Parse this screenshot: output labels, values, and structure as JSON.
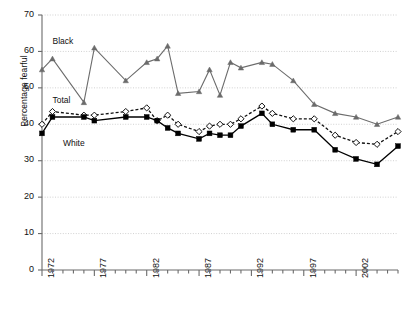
{
  "chart_data": {
    "type": "line",
    "title": "",
    "xlabel": "",
    "ylabel": "Percentage fearful",
    "ylim": [
      0,
      70
    ],
    "xlim": [
      1972,
      2006
    ],
    "yticks": [
      0,
      10,
      20,
      30,
      40,
      50,
      60,
      70
    ],
    "xticks_labeled": [
      1972,
      1977,
      1982,
      1987,
      1992,
      1997,
      2002
    ],
    "xtick_interval": 1,
    "grid": true,
    "legend_position": "inline-annotations",
    "annotations": [
      {
        "text": "Black",
        "x": 1973,
        "y": 62.5
      },
      {
        "text": "Total",
        "x": 1973,
        "y": 46.5
      },
      {
        "text": "White",
        "x": 1974,
        "y": 34.5
      }
    ],
    "series": [
      {
        "name": "Black",
        "color": "#6b6b6b",
        "marker": "triangle",
        "linestyle": "solid",
        "x": [
          1972,
          1973,
          1976,
          1977,
          1980,
          1982,
          1983,
          1984,
          1985,
          1987,
          1988,
          1989,
          1990,
          1991,
          1993,
          1994,
          1996,
          1998,
          2000,
          2002,
          2004,
          2006
        ],
        "y": [
          55.0,
          58.0,
          46.0,
          61.0,
          52.0,
          57.0,
          58.0,
          61.5,
          48.5,
          49.0,
          55.0,
          48.0,
          57.0,
          55.5,
          57.0,
          56.5,
          52.0,
          45.5,
          43.0,
          42.0,
          40.0,
          42.0
        ]
      },
      {
        "name": "Total",
        "color": "#111111",
        "marker": "open-diamond",
        "linestyle": "dashed",
        "x": [
          1972,
          1973,
          1976,
          1977,
          1980,
          1982,
          1983,
          1984,
          1985,
          1987,
          1988,
          1989,
          1990,
          1991,
          1993,
          1994,
          1996,
          1998,
          2000,
          2002,
          2004,
          2006
        ],
        "y": [
          40.0,
          43.5,
          42.5,
          42.5,
          43.5,
          44.5,
          41.0,
          42.5,
          40.0,
          38.0,
          39.5,
          40.0,
          40.0,
          41.5,
          45.0,
          43.0,
          41.5,
          41.5,
          37.0,
          35.0,
          34.5,
          38.0
        ]
      },
      {
        "name": "White",
        "color": "#000000",
        "marker": "filled-square",
        "linestyle": "solid",
        "x": [
          1972,
          1973,
          1976,
          1977,
          1980,
          1982,
          1983,
          1984,
          1985,
          1987,
          1988,
          1989,
          1990,
          1991,
          1993,
          1994,
          1996,
          1998,
          2000,
          2002,
          2004,
          2006
        ],
        "y": [
          37.5,
          42.0,
          42.0,
          41.0,
          42.0,
          42.0,
          41.0,
          39.0,
          37.5,
          36.0,
          37.5,
          37.0,
          37.0,
          39.5,
          43.0,
          40.0,
          38.5,
          38.5,
          33.0,
          30.5,
          29.0,
          34.0
        ]
      }
    ]
  },
  "colors": {
    "axis": "#6b6b6b",
    "grid": "#bdbdbd",
    "black_series": "#6b6b6b",
    "total_series": "#111111",
    "white_series": "#000000",
    "text": "#111111"
  }
}
